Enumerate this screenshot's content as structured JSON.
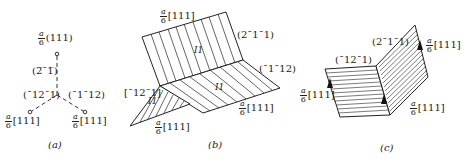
{
  "figure": {
    "panels": [
      {
        "id": "a",
        "caption": "(a)",
        "labels": {
          "top_vector_num": "a",
          "top_vector_den": "6",
          "top_vector_dir": "(111)",
          "vertical_plane": "(2̅¯1̅)",
          "left_plane": "(¯12¯1)",
          "right_plane": "(¯1¯12)",
          "left_vector_num": "a",
          "left_vector_den": "6",
          "left_vector_dir": "[111]",
          "right_vector_num": "a",
          "right_vector_den": "6",
          "right_vector_dir": "[111]"
        }
      },
      {
        "id": "b",
        "caption": "(b)",
        "labels": {
          "top_vector_num": "a",
          "top_vector_den": "6",
          "top_vector_dir": "[111]",
          "upper_plane": "(2¯1¯1)",
          "right_plane": "(¯1¯12)",
          "left_plane": "[¯12¯1]",
          "fault_upper": "I1",
          "fault_middle": "I1",
          "fault_lower": "I1",
          "mid_vector_num": "a",
          "mid_vector_den": "6",
          "mid_vector_dir": "[111]",
          "bottom_vector_num": "a",
          "bottom_vector_den": "6",
          "bottom_vector_dir": "[111]"
        }
      },
      {
        "id": "c",
        "caption": "(c)",
        "labels": {
          "left_plane": "(¯12¯1)",
          "right_plane": "(2¯1¯1)",
          "left_vector_num": "a",
          "left_vector_den": "6",
          "left_vector_dir": "[111]",
          "right_top_vector_num": "a",
          "right_top_vector_den": "6",
          "right_top_vector_dir": "[111]",
          "right_bottom_vector_num": "a",
          "right_bottom_vector_den": "6",
          "right_bottom_vector_dir": "[111]"
        }
      }
    ]
  }
}
